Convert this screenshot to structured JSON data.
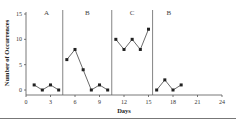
{
  "chart_data": {
    "type": "line",
    "title": "",
    "xlabel": "Days",
    "ylabel": "Number of Occurrences",
    "xlim": [
      0,
      24
    ],
    "ylim": [
      0,
      15
    ],
    "x_ticks": [
      0,
      3,
      6,
      9,
      12,
      15,
      18,
      21,
      24
    ],
    "y_ticks": [
      0,
      5,
      10,
      15
    ],
    "grid": false,
    "phase_lines_after_day": [
      4.5,
      10.5,
      15.5
    ],
    "phases": [
      {
        "label": "A",
        "x": [
          1,
          2,
          3,
          4
        ],
        "values": [
          1,
          0,
          1,
          0
        ]
      },
      {
        "label": "B",
        "x": [
          5,
          6,
          7,
          8,
          9,
          10
        ],
        "values": [
          6,
          8,
          4,
          0,
          1,
          0
        ]
      },
      {
        "label": "C",
        "x": [
          11,
          12,
          13,
          14,
          15
        ],
        "values": [
          10,
          8,
          10,
          8,
          12
        ]
      },
      {
        "label": "B",
        "x": [
          16,
          17,
          18,
          19
        ],
        "values": [
          0,
          2,
          0,
          1
        ]
      }
    ]
  }
}
